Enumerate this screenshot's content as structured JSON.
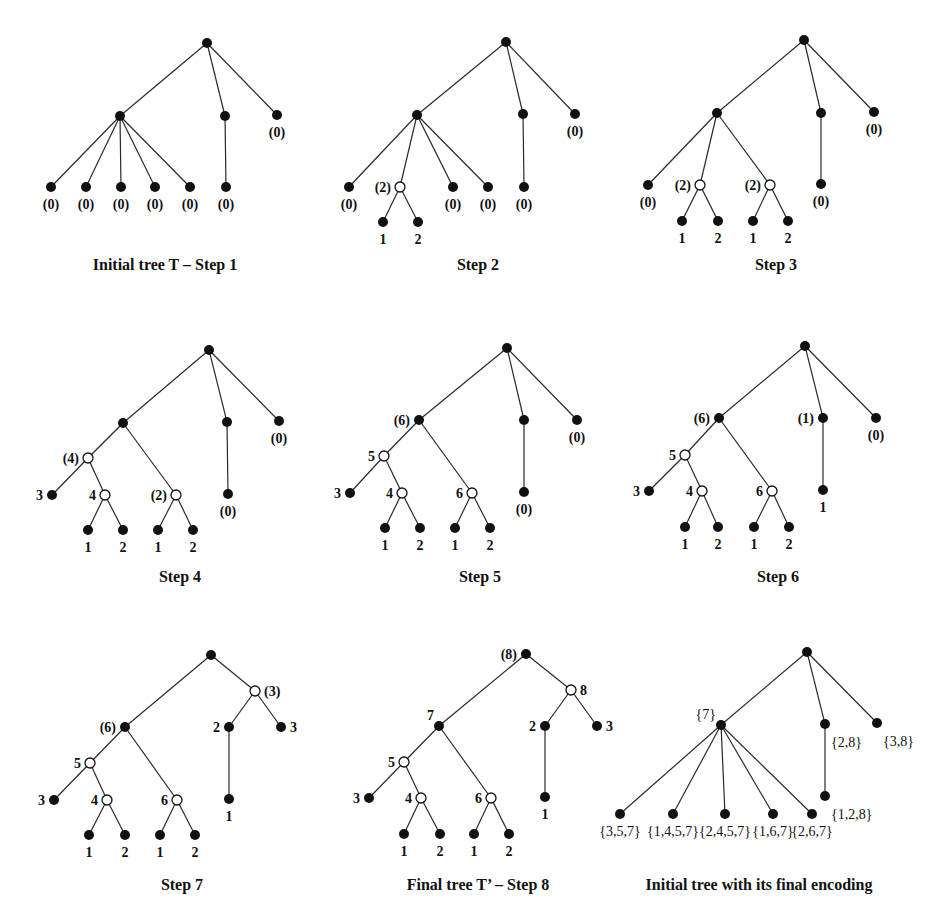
{
  "figure": {
    "panels": [
      {
        "id": "step1",
        "caption": "Initial tree T – Step 1",
        "nodes": [
          {
            "id": "r",
            "type": "filled",
            "label": ""
          },
          {
            "id": "a",
            "type": "filled",
            "label": ""
          },
          {
            "id": "b",
            "type": "filled",
            "label": ""
          },
          {
            "id": "c",
            "type": "filled",
            "label": "(0)"
          },
          {
            "id": "a1",
            "type": "filled",
            "label": "(0)"
          },
          {
            "id": "a2",
            "type": "filled",
            "label": "(0)"
          },
          {
            "id": "a3",
            "type": "filled",
            "label": "(0)"
          },
          {
            "id": "a4",
            "type": "filled",
            "label": "(0)"
          },
          {
            "id": "a5",
            "type": "filled",
            "label": "(0)"
          },
          {
            "id": "b1",
            "type": "filled",
            "label": "(0)"
          }
        ],
        "edges": [
          [
            "r",
            "a"
          ],
          [
            "r",
            "b"
          ],
          [
            "r",
            "c"
          ],
          [
            "a",
            "a1"
          ],
          [
            "a",
            "a2"
          ],
          [
            "a",
            "a3"
          ],
          [
            "a",
            "a4"
          ],
          [
            "a",
            "a5"
          ],
          [
            "b",
            "b1"
          ]
        ]
      },
      {
        "id": "step2",
        "caption": "Step 2",
        "nodes": [
          {
            "id": "r",
            "type": "filled",
            "label": ""
          },
          {
            "id": "a",
            "type": "filled",
            "label": ""
          },
          {
            "id": "b",
            "type": "filled",
            "label": ""
          },
          {
            "id": "c",
            "type": "filled",
            "label": "(0)"
          },
          {
            "id": "a1",
            "type": "filled",
            "label": "(0)"
          },
          {
            "id": "n2",
            "type": "open",
            "label": "(2)"
          },
          {
            "id": "n2a",
            "type": "filled",
            "label": "1"
          },
          {
            "id": "n2b",
            "type": "filled",
            "label": "2"
          },
          {
            "id": "a4",
            "type": "filled",
            "label": "(0)"
          },
          {
            "id": "a5",
            "type": "filled",
            "label": "(0)"
          },
          {
            "id": "b1",
            "type": "filled",
            "label": "(0)"
          }
        ],
        "edges": [
          [
            "r",
            "a"
          ],
          [
            "r",
            "b"
          ],
          [
            "r",
            "c"
          ],
          [
            "a",
            "a1"
          ],
          [
            "a",
            "n2"
          ],
          [
            "n2",
            "n2a"
          ],
          [
            "n2",
            "n2b"
          ],
          [
            "a",
            "a4"
          ],
          [
            "a",
            "a5"
          ],
          [
            "b",
            "b1"
          ]
        ]
      },
      {
        "id": "step3",
        "caption": "Step 3",
        "nodes": [
          {
            "id": "r",
            "type": "filled",
            "label": ""
          },
          {
            "id": "a",
            "type": "filled",
            "label": ""
          },
          {
            "id": "b",
            "type": "filled",
            "label": ""
          },
          {
            "id": "c",
            "type": "filled",
            "label": "(0)"
          },
          {
            "id": "a1",
            "type": "filled",
            "label": "(0)"
          },
          {
            "id": "n2",
            "type": "open",
            "label": "(2)"
          },
          {
            "id": "n2a",
            "type": "filled",
            "label": "1"
          },
          {
            "id": "n2b",
            "type": "filled",
            "label": "2"
          },
          {
            "id": "n3",
            "type": "open",
            "label": "(2)"
          },
          {
            "id": "n3a",
            "type": "filled",
            "label": "1"
          },
          {
            "id": "n3b",
            "type": "filled",
            "label": "2"
          },
          {
            "id": "b1",
            "type": "filled",
            "label": "(0)"
          }
        ],
        "edges": [
          [
            "r",
            "a"
          ],
          [
            "r",
            "b"
          ],
          [
            "r",
            "c"
          ],
          [
            "a",
            "a1"
          ],
          [
            "a",
            "n2"
          ],
          [
            "n2",
            "n2a"
          ],
          [
            "n2",
            "n2b"
          ],
          [
            "a",
            "n3"
          ],
          [
            "n3",
            "n3a"
          ],
          [
            "n3",
            "n3b"
          ],
          [
            "b",
            "b1"
          ]
        ]
      },
      {
        "id": "step4",
        "caption": "Step 4",
        "nodes": [
          {
            "id": "r",
            "type": "filled",
            "label": ""
          },
          {
            "id": "a",
            "type": "filled",
            "label": ""
          },
          {
            "id": "b",
            "type": "filled",
            "label": ""
          },
          {
            "id": "c",
            "type": "filled",
            "label": "(0)"
          },
          {
            "id": "p",
            "type": "open",
            "label": "(4)"
          },
          {
            "id": "l3",
            "type": "filled",
            "label": "3"
          },
          {
            "id": "q",
            "type": "open",
            "label": "4"
          },
          {
            "id": "q1",
            "type": "filled",
            "label": "1"
          },
          {
            "id": "q2",
            "type": "filled",
            "label": "2"
          },
          {
            "id": "s",
            "type": "open",
            "label": "(2)"
          },
          {
            "id": "s1",
            "type": "filled",
            "label": "1"
          },
          {
            "id": "s2",
            "type": "filled",
            "label": "2"
          },
          {
            "id": "b1",
            "type": "filled",
            "label": "(0)"
          }
        ],
        "edges": [
          [
            "r",
            "a"
          ],
          [
            "r",
            "b"
          ],
          [
            "r",
            "c"
          ],
          [
            "a",
            "p"
          ],
          [
            "p",
            "l3"
          ],
          [
            "p",
            "q"
          ],
          [
            "q",
            "q1"
          ],
          [
            "q",
            "q2"
          ],
          [
            "a",
            "s"
          ],
          [
            "s",
            "s1"
          ],
          [
            "s",
            "s2"
          ],
          [
            "b",
            "b1"
          ]
        ]
      },
      {
        "id": "step5",
        "caption": "Step 5",
        "nodes": [
          {
            "id": "r",
            "type": "filled",
            "label": ""
          },
          {
            "id": "a",
            "type": "filled",
            "label": "(6)"
          },
          {
            "id": "b",
            "type": "filled",
            "label": ""
          },
          {
            "id": "c",
            "type": "filled",
            "label": "(0)"
          },
          {
            "id": "p",
            "type": "open",
            "label": "5"
          },
          {
            "id": "l3",
            "type": "filled",
            "label": "3"
          },
          {
            "id": "q",
            "type": "open",
            "label": "4"
          },
          {
            "id": "q1",
            "type": "filled",
            "label": "1"
          },
          {
            "id": "q2",
            "type": "filled",
            "label": "2"
          },
          {
            "id": "s",
            "type": "open",
            "label": "6"
          },
          {
            "id": "s1",
            "type": "filled",
            "label": "1"
          },
          {
            "id": "s2",
            "type": "filled",
            "label": "2"
          },
          {
            "id": "b1",
            "type": "filled",
            "label": "(0)"
          }
        ],
        "edges": [
          [
            "r",
            "a"
          ],
          [
            "r",
            "b"
          ],
          [
            "r",
            "c"
          ],
          [
            "a",
            "p"
          ],
          [
            "p",
            "l3"
          ],
          [
            "p",
            "q"
          ],
          [
            "q",
            "q1"
          ],
          [
            "q",
            "q2"
          ],
          [
            "a",
            "s"
          ],
          [
            "s",
            "s1"
          ],
          [
            "s",
            "s2"
          ],
          [
            "b",
            "b1"
          ]
        ]
      },
      {
        "id": "step6",
        "caption": "Step 6",
        "nodes": [
          {
            "id": "r",
            "type": "filled",
            "label": ""
          },
          {
            "id": "a",
            "type": "filled",
            "label": "(6)"
          },
          {
            "id": "b",
            "type": "filled",
            "label": "(1)"
          },
          {
            "id": "c",
            "type": "filled",
            "label": "(0)"
          },
          {
            "id": "p",
            "type": "open",
            "label": "5"
          },
          {
            "id": "l3",
            "type": "filled",
            "label": "3"
          },
          {
            "id": "q",
            "type": "open",
            "label": "4"
          },
          {
            "id": "q1",
            "type": "filled",
            "label": "1"
          },
          {
            "id": "q2",
            "type": "filled",
            "label": "2"
          },
          {
            "id": "s",
            "type": "open",
            "label": "6"
          },
          {
            "id": "s1",
            "type": "filled",
            "label": "1"
          },
          {
            "id": "s2",
            "type": "filled",
            "label": "2"
          },
          {
            "id": "b1",
            "type": "filled",
            "label": "1"
          }
        ],
        "edges": [
          [
            "r",
            "a"
          ],
          [
            "r",
            "b"
          ],
          [
            "r",
            "c"
          ],
          [
            "a",
            "p"
          ],
          [
            "p",
            "l3"
          ],
          [
            "p",
            "q"
          ],
          [
            "q",
            "q1"
          ],
          [
            "q",
            "q2"
          ],
          [
            "a",
            "s"
          ],
          [
            "s",
            "s1"
          ],
          [
            "s",
            "s2"
          ],
          [
            "b",
            "b1"
          ]
        ]
      },
      {
        "id": "step7",
        "caption": "Step 7",
        "nodes": [
          {
            "id": "r",
            "type": "filled",
            "label": ""
          },
          {
            "id": "a",
            "type": "filled",
            "label": "(6)"
          },
          {
            "id": "t",
            "type": "open",
            "label": "(3)"
          },
          {
            "id": "b",
            "type": "filled",
            "label": "2"
          },
          {
            "id": "c",
            "type": "filled",
            "label": "3"
          },
          {
            "id": "p",
            "type": "open",
            "label": "5"
          },
          {
            "id": "l3",
            "type": "filled",
            "label": "3"
          },
          {
            "id": "q",
            "type": "open",
            "label": "4"
          },
          {
            "id": "q1",
            "type": "filled",
            "label": "1"
          },
          {
            "id": "q2",
            "type": "filled",
            "label": "2"
          },
          {
            "id": "s",
            "type": "open",
            "label": "6"
          },
          {
            "id": "s1",
            "type": "filled",
            "label": "1"
          },
          {
            "id": "s2",
            "type": "filled",
            "label": "2"
          },
          {
            "id": "b1",
            "type": "filled",
            "label": "1"
          }
        ],
        "edges": [
          [
            "r",
            "a"
          ],
          [
            "r",
            "t"
          ],
          [
            "t",
            "b"
          ],
          [
            "t",
            "c"
          ],
          [
            "a",
            "p"
          ],
          [
            "p",
            "l3"
          ],
          [
            "p",
            "q"
          ],
          [
            "q",
            "q1"
          ],
          [
            "q",
            "q2"
          ],
          [
            "a",
            "s"
          ],
          [
            "s",
            "s1"
          ],
          [
            "s",
            "s2"
          ],
          [
            "b",
            "b1"
          ]
        ]
      },
      {
        "id": "step8",
        "caption": "Final tree T’ – Step 8",
        "nodes": [
          {
            "id": "r",
            "type": "filled",
            "label": "(8)"
          },
          {
            "id": "a",
            "type": "filled",
            "label": "7"
          },
          {
            "id": "t",
            "type": "open",
            "label": "8"
          },
          {
            "id": "b",
            "type": "filled",
            "label": "2"
          },
          {
            "id": "c",
            "type": "filled",
            "label": "3"
          },
          {
            "id": "p",
            "type": "open",
            "label": "5"
          },
          {
            "id": "l3",
            "type": "filled",
            "label": "3"
          },
          {
            "id": "q",
            "type": "open",
            "label": "4"
          },
          {
            "id": "q1",
            "type": "filled",
            "label": "1"
          },
          {
            "id": "q2",
            "type": "filled",
            "label": "2"
          },
          {
            "id": "s",
            "type": "open",
            "label": "6"
          },
          {
            "id": "s1",
            "type": "filled",
            "label": "1"
          },
          {
            "id": "s2",
            "type": "filled",
            "label": "2"
          },
          {
            "id": "b1",
            "type": "filled",
            "label": "1"
          }
        ],
        "edges": [
          [
            "r",
            "a"
          ],
          [
            "r",
            "t"
          ],
          [
            "t",
            "b"
          ],
          [
            "t",
            "c"
          ],
          [
            "a",
            "p"
          ],
          [
            "p",
            "l3"
          ],
          [
            "p",
            "q"
          ],
          [
            "q",
            "q1"
          ],
          [
            "q",
            "q2"
          ],
          [
            "a",
            "s"
          ],
          [
            "s",
            "s1"
          ],
          [
            "s",
            "s2"
          ],
          [
            "b",
            "b1"
          ]
        ]
      },
      {
        "id": "encoding",
        "caption": "Initial tree with its final encoding",
        "nodes": [
          {
            "id": "r",
            "type": "filled",
            "label": ""
          },
          {
            "id": "a",
            "type": "filled",
            "label": "{7}"
          },
          {
            "id": "b",
            "type": "filled",
            "label": "{2,8}"
          },
          {
            "id": "c",
            "type": "filled",
            "label": "{3,8}"
          },
          {
            "id": "a1",
            "type": "filled",
            "label": "{3,5,7}"
          },
          {
            "id": "a2",
            "type": "filled",
            "label": "{1,4,5,7}"
          },
          {
            "id": "a3",
            "type": "filled",
            "label": "{2,4,5,7}"
          },
          {
            "id": "a4",
            "type": "filled",
            "label": "{1,6,7}"
          },
          {
            "id": "a5",
            "type": "filled",
            "label": "{2,6,7}"
          },
          {
            "id": "b1",
            "type": "filled",
            "label": "{1,2,8}"
          }
        ],
        "edges": [
          [
            "r",
            "a"
          ],
          [
            "r",
            "b"
          ],
          [
            "r",
            "c"
          ],
          [
            "a",
            "a1"
          ],
          [
            "a",
            "a2"
          ],
          [
            "a",
            "a3"
          ],
          [
            "a",
            "a4"
          ],
          [
            "a",
            "a5"
          ],
          [
            "b",
            "b1"
          ]
        ]
      }
    ]
  }
}
